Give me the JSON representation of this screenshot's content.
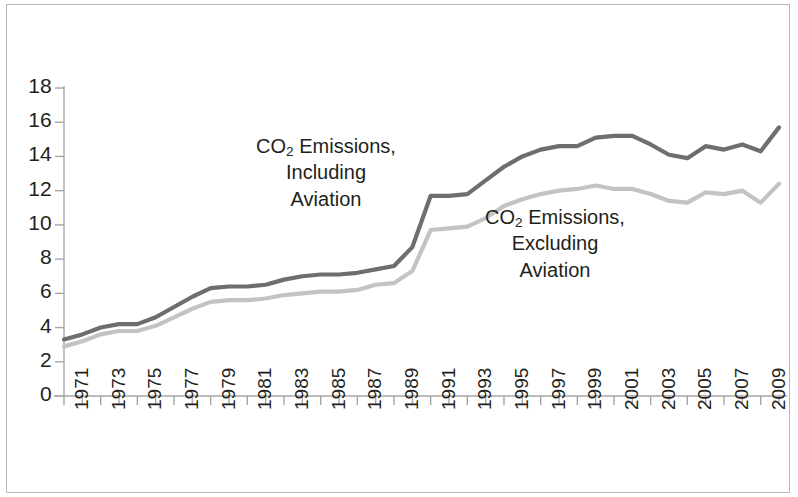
{
  "figure": {
    "background_color": "#ffffff",
    "frame_color": "#b8b8b8",
    "axis_color": "#a6a6a6",
    "text_color": "#231f20"
  },
  "annotations": {
    "including": {
      "line1_pre": "CO",
      "line1_sub": "2",
      "line1_post": " Emissions,",
      "line2": "Including",
      "line3": "Aviation"
    },
    "excluding": {
      "line1_pre": "CO",
      "line1_sub": "2",
      "line1_post": " Emissions,",
      "line2": "Excluding",
      "line3": "Aviation"
    }
  },
  "chart_data": {
    "type": "line",
    "title": "",
    "xlabel": "",
    "ylabel": "",
    "grid": false,
    "legend_position": "inline-annotation",
    "xlim": [
      1971,
      2010
    ],
    "ylim": [
      0,
      18
    ],
    "ytick_labels": [
      "18",
      "16",
      "14",
      "12",
      "10",
      "8",
      "6",
      "4",
      "2",
      "0"
    ],
    "ytick_values": [
      18,
      16,
      14,
      12,
      10,
      8,
      6,
      4,
      2,
      0
    ],
    "xtick_labels": [
      "1971",
      "1973",
      "1975",
      "1977",
      "1979",
      "1981",
      "1983",
      "1985",
      "1987",
      "1989",
      "1991",
      "1993",
      "1995",
      "1997",
      "1999",
      "2001",
      "2003",
      "2005",
      "2007",
      "2009"
    ],
    "xtick_values": [
      1971,
      1973,
      1975,
      1977,
      1979,
      1981,
      1983,
      1985,
      1987,
      1989,
      1991,
      1993,
      1995,
      1997,
      1999,
      2001,
      2003,
      2005,
      2007,
      2009
    ],
    "x": [
      1971,
      1972,
      1973,
      1974,
      1975,
      1976,
      1977,
      1978,
      1979,
      1980,
      1981,
      1982,
      1983,
      1984,
      1985,
      1986,
      1987,
      1988,
      1989,
      1990,
      1991,
      1992,
      1993,
      1994,
      1995,
      1996,
      1997,
      1998,
      1999,
      2000,
      2001,
      2002,
      2003,
      2004,
      2005,
      2006,
      2007,
      2008,
      2009,
      2010
    ],
    "series": [
      {
        "name": "CO2 Emissions, Including Aviation",
        "color": "#6e6e6e",
        "width": 4.2,
        "values": [
          3.3,
          3.6,
          4.0,
          4.2,
          4.2,
          4.6,
          5.2,
          5.8,
          6.3,
          6.4,
          6.4,
          6.5,
          6.8,
          7.0,
          7.1,
          7.1,
          7.2,
          7.4,
          7.6,
          8.7,
          11.7,
          11.7,
          11.8,
          12.6,
          13.4,
          14.0,
          14.4,
          14.6,
          14.6,
          15.1,
          15.2,
          15.2,
          14.7,
          14.1,
          13.9,
          14.6,
          14.4,
          14.7,
          14.3,
          15.7
        ]
      },
      {
        "name": "CO2 Emissions, Excluding Aviation",
        "color": "#c3c3c3",
        "width": 4.2,
        "values": [
          2.9,
          3.2,
          3.6,
          3.8,
          3.8,
          4.1,
          4.6,
          5.1,
          5.5,
          5.6,
          5.6,
          5.7,
          5.9,
          6.0,
          6.1,
          6.1,
          6.2,
          6.5,
          6.6,
          7.3,
          9.7,
          9.8,
          9.9,
          10.4,
          11.1,
          11.5,
          11.8,
          12.0,
          12.1,
          12.3,
          12.1,
          12.1,
          11.8,
          11.4,
          11.3,
          11.9,
          11.8,
          12.0,
          11.3,
          12.4
        ]
      }
    ]
  }
}
